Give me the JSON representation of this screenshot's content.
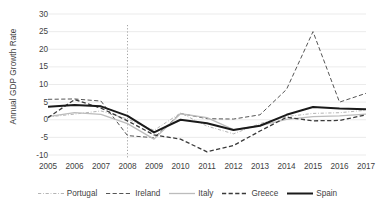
{
  "chart_data": {
    "type": "line",
    "title": "",
    "subtitle": "",
    "xlabel": "",
    "ylabel": "Annual GDP Growth Rate",
    "x": [
      2005,
      2006,
      2007,
      2008,
      2009,
      2010,
      2011,
      2012,
      2013,
      2014,
      2015,
      2016,
      2017
    ],
    "xtick_labels": [
      "2005",
      "2006",
      "2007",
      "2008",
      "2009",
      "2010",
      "2011",
      "2012",
      "2013",
      "2014",
      "2015",
      "2016",
      "2017"
    ],
    "ytick_labels": [
      "30",
      "25",
      "20",
      "15",
      "10",
      "5",
      "0",
      "-5",
      "-10"
    ],
    "yticks": [
      30,
      25,
      20,
      15,
      10,
      5,
      0,
      -5,
      -10
    ],
    "ylim": [
      -10,
      30
    ],
    "xlim": [
      2005,
      2017
    ],
    "grid": "horizontal",
    "legend_position": "bottom",
    "annotations": [
      {
        "type": "vline",
        "x": 2008,
        "style": "dotted",
        "color": "#9a9a9a",
        "label": ""
      }
    ],
    "series": [
      {
        "name": "Portugal",
        "color": "#b4b4b4",
        "style": "dashdot",
        "width": 1.0,
        "values": [
          0.8,
          1.6,
          2.5,
          0.2,
          -3.0,
          1.9,
          -1.8,
          -4.0,
          -1.1,
          0.9,
          1.8,
          2.0,
          2.7
        ]
      },
      {
        "name": "Ireland",
        "color": "#555555",
        "style": "dashed",
        "width": 1.0,
        "values": [
          5.8,
          5.9,
          5.3,
          -4.5,
          -5.1,
          1.8,
          0.3,
          0.2,
          1.4,
          8.6,
          25.0,
          5.0,
          7.5
        ]
      },
      {
        "name": "Italy",
        "color": "#bcbcbc",
        "style": "solid",
        "width": 1.3,
        "values": [
          0.9,
          2.0,
          1.5,
          -1.1,
          -5.5,
          1.7,
          0.6,
          -2.8,
          -1.7,
          0.1,
          0.9,
          1.1,
          1.6
        ]
      },
      {
        "name": "Greece",
        "color": "#3a3a3a",
        "style": "dashed",
        "width": 1.3,
        "values": [
          0.6,
          5.7,
          3.3,
          -0.3,
          -4.3,
          -5.5,
          -9.1,
          -7.3,
          -3.2,
          0.7,
          -0.3,
          -0.2,
          1.4
        ]
      },
      {
        "name": "Spain",
        "color": "#1a1a1a",
        "style": "solid",
        "width": 2.0,
        "values": [
          3.7,
          4.2,
          3.8,
          1.1,
          -3.6,
          0.0,
          -1.0,
          -2.9,
          -1.7,
          1.4,
          3.6,
          3.2,
          3.0
        ]
      }
    ]
  },
  "legend": {
    "items": [
      {
        "label": "Portugal"
      },
      {
        "label": "Ireland"
      },
      {
        "label": "Italy"
      },
      {
        "label": "Greece"
      },
      {
        "label": "Spain"
      }
    ]
  }
}
